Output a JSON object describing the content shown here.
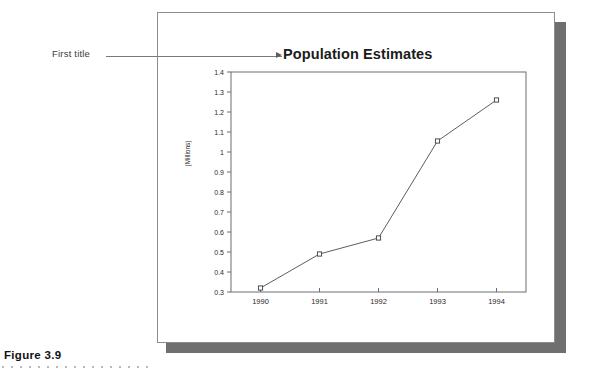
{
  "page": {
    "figure_caption": "Figure 3.9",
    "callout": {
      "label": "First title",
      "arrow_icon": "arrow-right-icon"
    }
  },
  "chart_data": {
    "type": "line",
    "title": "Population Estimates",
    "xlabel": "",
    "ylabel": "(Millions)",
    "categories": [
      "1990",
      "1991",
      "1992",
      "1993",
      "1994"
    ],
    "values": [
      0.32,
      0.49,
      0.57,
      1.055,
      1.26
    ],
    "series": [
      {
        "name": "Population Estimates",
        "values": [
          0.32,
          0.49,
          0.57,
          1.055,
          1.26
        ]
      }
    ],
    "ylim": [
      0.3,
      1.4
    ],
    "ytick_values": [
      0.3,
      0.4,
      0.5,
      0.6,
      0.7,
      0.8,
      0.9,
      1.0,
      1.1,
      1.2,
      1.3,
      1.4
    ],
    "ytick_labels": [
      "0.3",
      "0.4",
      "0.5",
      "0.6",
      "0.7",
      "0.8",
      "0.9",
      "1",
      "1.1",
      "1.2",
      "1.3",
      "1.4"
    ],
    "grid": false,
    "legend": false,
    "marker": "open-square",
    "line_color": "#4a4a54",
    "marker_color": "#3b3b45",
    "axis_color": "#6c6c74",
    "plot_background": "#ffffff"
  }
}
